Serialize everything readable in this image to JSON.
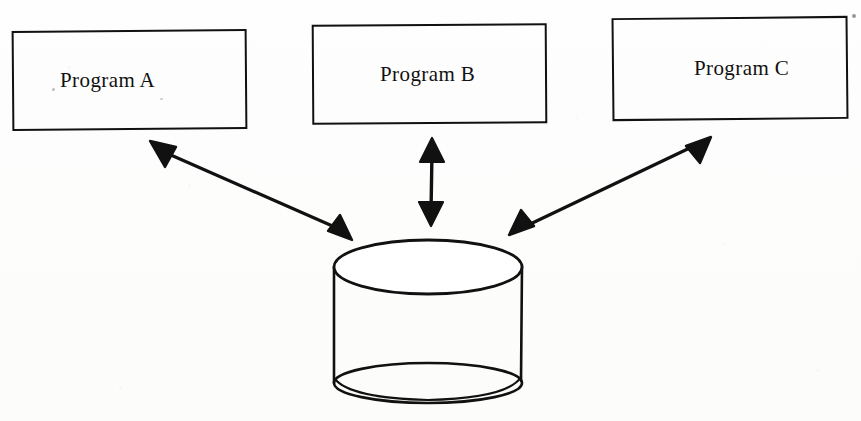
{
  "diagram": {
    "background_color": "#fdfdfd",
    "stroke_color": "#111111",
    "fill_color": "none",
    "programs": [
      {
        "id": "program-a",
        "label": "Program A"
      },
      {
        "id": "program-b",
        "label": "Program B"
      },
      {
        "id": "program-c",
        "label": "Program C"
      }
    ],
    "datastore": {
      "id": "shared-database",
      "shape": "cylinder",
      "label": ""
    },
    "connectors": [
      {
        "id": "connector-a",
        "from": "program-a",
        "to": "shared-database",
        "style": "double-headed-arrow",
        "label": ""
      },
      {
        "id": "connector-b",
        "from": "program-b",
        "to": "shared-database",
        "style": "double-headed-arrow",
        "label": ""
      },
      {
        "id": "connector-c",
        "from": "program-c",
        "to": "shared-database",
        "style": "double-headed-arrow",
        "label": ""
      }
    ]
  }
}
